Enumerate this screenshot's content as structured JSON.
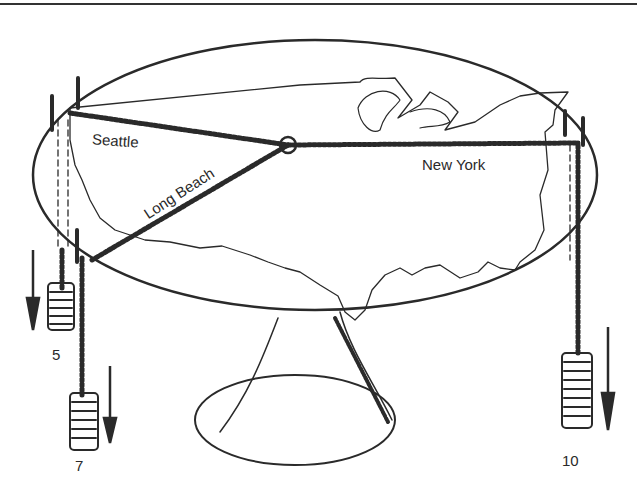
{
  "diagram": {
    "type": "physical-model illustration",
    "cities": [
      {
        "name": "Seattle",
        "weight": "5"
      },
      {
        "name": "Long Beach",
        "weight": "7"
      },
      {
        "name": "New York",
        "weight": "10"
      }
    ],
    "labels": {
      "seattle": "Seattle",
      "long_beach": "Long Beach",
      "new_york": "New York",
      "weight_seattle": "5",
      "weight_long_beach": "7",
      "weight_new_york": "10"
    },
    "colors": {
      "ink": "#2a2a2a",
      "background": "#ffffff"
    }
  }
}
